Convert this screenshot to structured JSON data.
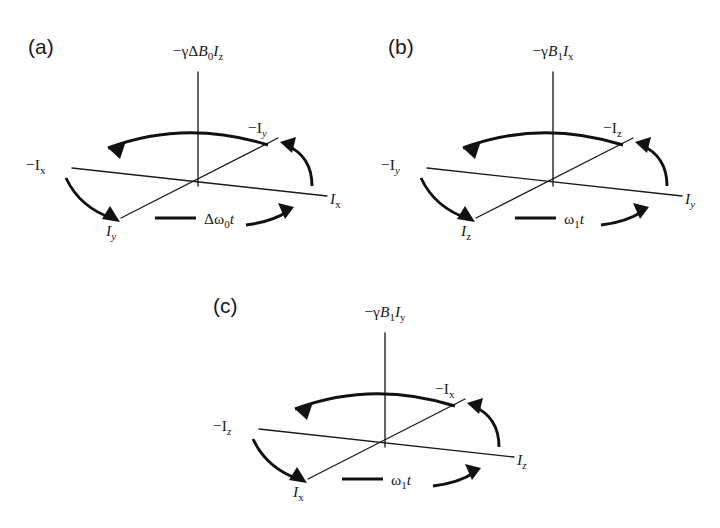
{
  "figure": {
    "background": "#ffffff",
    "ink_color": "#1a1a1a"
  },
  "panels": [
    {
      "id": "a",
      "letter": "(a)",
      "operator_label": {
        "full": "−γΔB₀Iᴢ",
        "prefix": "−γΔ",
        "field": "B",
        "field_sub": "0",
        "spin": "I",
        "spin_sub": "z"
      },
      "axes": {
        "vertical_top": "−γΔB₀Iᴢ",
        "left": "−I",
        "left_sub": "x",
        "right": "I",
        "right_sub": "x",
        "upper_right": "−I",
        "upper_right_sub": "y",
        "lower_left": "I",
        "lower_left_sub": "y"
      },
      "rotation_label": {
        "symbol": "Δω",
        "sub": "0",
        "time": "t",
        "full": "Δω₀t"
      }
    },
    {
      "id": "b",
      "letter": "(b)",
      "operator_label": {
        "full": "−γB₁Iₓ",
        "prefix": "−γ",
        "field": "B",
        "field_sub": "1",
        "spin": "I",
        "spin_sub": "x"
      },
      "axes": {
        "vertical_top": "−γB₁Iₓ",
        "left": "−I",
        "left_sub": "y",
        "right": "I",
        "right_sub": "y",
        "upper_right": "−I",
        "upper_right_sub": "z",
        "lower_left": "I",
        "lower_left_sub": "z"
      },
      "rotation_label": {
        "symbol": "ω",
        "sub": "1",
        "time": "t",
        "full": "ω₁t"
      }
    },
    {
      "id": "c",
      "letter": "(c)",
      "operator_label": {
        "full": "−γB₁Iᵧ",
        "prefix": "−γ",
        "field": "B",
        "field_sub": "1",
        "spin": "I",
        "spin_sub": "y"
      },
      "axes": {
        "vertical_top": "−γB₁Iᵧ",
        "left": "−I",
        "left_sub": "z",
        "right": "I",
        "right_sub": "z",
        "upper_right": "−I",
        "upper_right_sub": "x",
        "lower_left": "I",
        "lower_left_sub": "x"
      },
      "rotation_label": {
        "symbol": "ω",
        "sub": "1",
        "time": "t",
        "full": "ω₁t"
      }
    }
  ],
  "glyphs": {
    "minus": "−",
    "gamma": "γ",
    "delta": "Δ",
    "omega": "ω"
  }
}
